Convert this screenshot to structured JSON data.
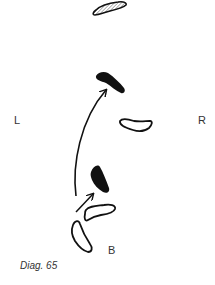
{
  "labels": {
    "left": "L",
    "right": "R",
    "back": "B"
  },
  "caption": "Diag. 65",
  "colors": {
    "ink": "#111111",
    "background": "#ffffff",
    "label": "#333333"
  },
  "footprints": [
    {
      "id": "top-hatched",
      "fill": "hatched",
      "position": "top-center"
    },
    {
      "id": "upper-solid",
      "fill": "solid",
      "position": "upper-center"
    },
    {
      "id": "right-outline",
      "fill": "outline",
      "position": "middle-right"
    },
    {
      "id": "lower-solid",
      "fill": "solid",
      "position": "lower-center"
    },
    {
      "id": "lower-outline",
      "fill": "outline",
      "position": "lower-center"
    },
    {
      "id": "bottom-outline",
      "fill": "outline",
      "position": "bottom-left"
    }
  ],
  "arrows": [
    {
      "id": "long-curve",
      "from": "bottom",
      "to": "upper-solid"
    },
    {
      "id": "short",
      "from": "lower-outline",
      "to": "lower-solid"
    }
  ]
}
